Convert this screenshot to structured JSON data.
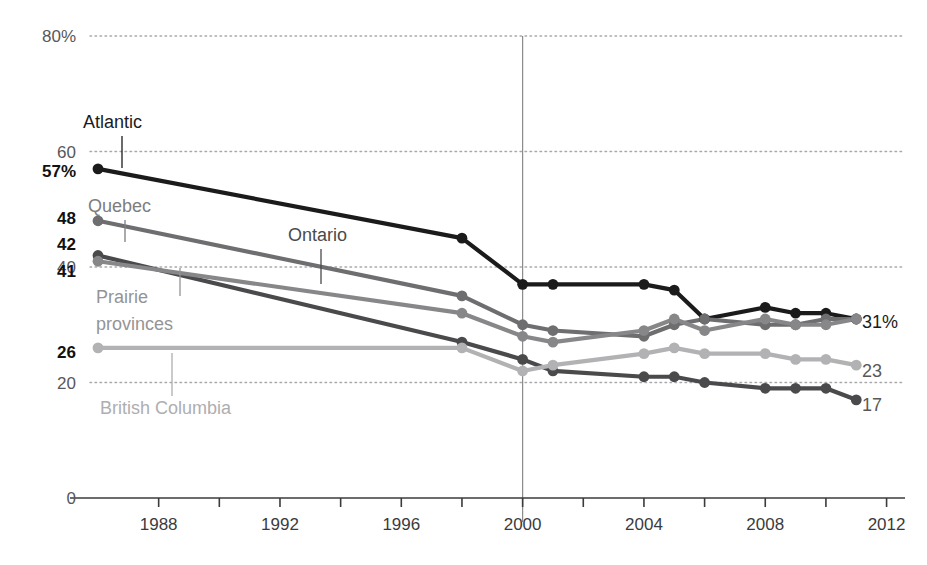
{
  "chart_data": {
    "type": "line",
    "title": "",
    "xlabel": "",
    "ylabel": "",
    "xlim": [
      1986,
      2012
    ],
    "ylim": [
      0,
      80
    ],
    "y_ticks": [
      {
        "value": 80,
        "label": "80%"
      },
      {
        "value": 60,
        "label": "60"
      },
      {
        "value": 40,
        "label": "40"
      },
      {
        "value": 20,
        "label": "20"
      },
      {
        "value": 0,
        "label": "0"
      }
    ],
    "y_gridlines": [
      80,
      60,
      40,
      20
    ],
    "x_ticks": [
      1988,
      1990,
      1992,
      1994,
      1996,
      1998,
      2000,
      2002,
      2004,
      2006,
      2008,
      2010,
      2012
    ],
    "x_tick_labels": [
      {
        "value": 1988,
        "label": "1988"
      },
      {
        "value": 1992,
        "label": "1992"
      },
      {
        "value": 1996,
        "label": "1996"
      },
      {
        "value": 2000,
        "label": "2000"
      },
      {
        "value": 2004,
        "label": "2004"
      },
      {
        "value": 2008,
        "label": "2008"
      },
      {
        "value": 2012,
        "label": "2012"
      }
    ],
    "grid": true,
    "legend": "inline-annotations",
    "annotation_line": {
      "x": 2000,
      "color": "#8a8a8c"
    },
    "series": [
      {
        "name": "Atlantic",
        "color": "#1b1b1b",
        "start_label": "57%",
        "end_label": "31%",
        "x": [
          1986,
          1998,
          2000,
          2001,
          2004,
          2005,
          2006,
          2008,
          2009,
          2010,
          2011
        ],
        "values": [
          57,
          45,
          37,
          37,
          37,
          36,
          31,
          33,
          32,
          32,
          31
        ]
      },
      {
        "name": "Quebec",
        "color": "#6e6e70",
        "start_label": "48",
        "end_label": "31",
        "x": [
          1986,
          1998,
          2000,
          2001,
          2004,
          2005,
          2006,
          2008,
          2009,
          2010,
          2011
        ],
        "values": [
          48,
          35,
          30,
          29,
          28,
          30,
          31,
          30,
          30,
          31,
          31
        ]
      },
      {
        "name": "Ontario",
        "color": "#4a4a4c",
        "start_label": "42",
        "end_label": "17",
        "x": [
          1986,
          1998,
          2000,
          2001,
          2004,
          2005,
          2006,
          2008,
          2009,
          2010,
          2011
        ],
        "values": [
          42,
          27,
          24,
          22,
          21,
          21,
          20,
          19,
          19,
          19,
          17
        ]
      },
      {
        "name": "Prairie provinces",
        "color": "#878789",
        "start_label": "41",
        "end_label": "31",
        "x": [
          1986,
          1998,
          2000,
          2001,
          2004,
          2005,
          2006,
          2008,
          2009,
          2010,
          2011
        ],
        "values": [
          41,
          32,
          28,
          27,
          29,
          31,
          29,
          31,
          30,
          30,
          31
        ]
      },
      {
        "name": "British Columbia",
        "color": "#b2b2b4",
        "start_label": "26",
        "end_label": "23",
        "x": [
          1986,
          1998,
          2000,
          2001,
          2004,
          2005,
          2006,
          2008,
          2009,
          2010,
          2011
        ],
        "values": [
          26,
          26,
          22,
          23,
          25,
          26,
          25,
          25,
          24,
          24,
          23
        ]
      }
    ],
    "series_annotations": [
      {
        "name": "Atlantic",
        "label": "Atlantic",
        "color": "#1b1b1b",
        "label_x": 83,
        "label_y": 128,
        "leader_x": 122,
        "leader_y1": 136,
        "leader_y2": 168
      },
      {
        "name": "Quebec",
        "label": "Quebec",
        "color": "#7d7d7f",
        "label_x": 88,
        "label_y": 212,
        "leader_x": 125,
        "leader_y1": 220,
        "leader_y2": 242
      },
      {
        "name": "Ontario",
        "label": "Ontario",
        "color": "#4a4a4c",
        "label_x": 288,
        "label_y": 241,
        "leader_x": 321,
        "leader_y1": 249,
        "leader_y2": 284
      },
      {
        "name": "Prairie provinces",
        "label": "Prairie",
        "label2": "provinces",
        "color": "#949496",
        "label_x": 96,
        "label_y": 303,
        "leader_x": 180,
        "leader_y1": 268,
        "leader_y2": 296
      },
      {
        "name": "British Columbia",
        "label": "British Columbia",
        "color": "#aeaeb0",
        "label_x": 100,
        "label_y": 414,
        "leader_x": 172,
        "leader_y1": 353,
        "leader_y2": 396
      }
    ],
    "start_value_labels": [
      {
        "text": "57%",
        "x": 76,
        "y": 177,
        "color": "#111111",
        "anchor": "end"
      },
      {
        "text": "48",
        "x": 76,
        "y": 224,
        "color": "#111111",
        "anchor": "end"
      },
      {
        "text": "42",
        "x": 76,
        "y": 250,
        "color": "#111111",
        "anchor": "end"
      },
      {
        "text": "41",
        "x": 76,
        "y": 277,
        "color": "#111111",
        "anchor": "end"
      },
      {
        "text": "26",
        "x": 76,
        "y": 358,
        "color": "#111111",
        "anchor": "end"
      }
    ],
    "end_value_labels": [
      {
        "text": "31%",
        "x": 862,
        "y": 328,
        "color": "#1b1b1b"
      },
      {
        "text": "23",
        "x": 862,
        "y": 377,
        "color": "#58585a"
      },
      {
        "text": "17",
        "x": 862,
        "y": 411,
        "color": "#58585a"
      }
    ]
  },
  "geometry": {
    "plot_x0": 98,
    "plot_x1": 846,
    "plot_right_grid": 905,
    "axis_y0": 498,
    "y_top": 36,
    "px_per_unit": 5.775,
    "px_per_year": 30.33,
    "year0": 1986
  }
}
